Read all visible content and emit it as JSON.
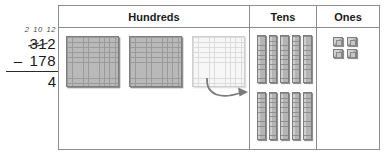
{
  "problem": {
    "regroup_marks": [
      "2",
      "10",
      "12"
    ],
    "minuend_digits": [
      "3",
      "1",
      "2"
    ],
    "minuend_struck": [
      "3",
      "1"
    ],
    "operator": "–",
    "subtrahend": "178",
    "partial_answer": "4"
  },
  "table": {
    "headers": {
      "hundreds": "Hundreds",
      "tens": "Tens",
      "ones": "Ones"
    },
    "hundreds": {
      "flat_count": 3,
      "solid_flats": 2,
      "faded_flats": 1,
      "flat_grid": "10x10"
    },
    "tens": {
      "rod_count": 10,
      "top_row_rods": 5,
      "bottom_row_rods": 5,
      "rod_segments": 10
    },
    "ones": {
      "cube_count": 4,
      "arrangement": "2x2"
    }
  },
  "annotation": {
    "arrow": "regroup-arrow",
    "arrow_from": "faded-hundreds-flat",
    "arrow_to": "tens-bottom-row"
  },
  "colors": {
    "block_fill": "#b9b9b9",
    "block_outline": "#7d7d7d",
    "faded_fill": "#f7f7f7",
    "table_border": "#8c8c8c",
    "ink": "#2a2a2a"
  }
}
